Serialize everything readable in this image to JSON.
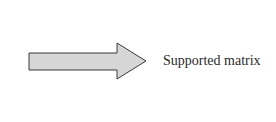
{
  "diagram": {
    "arrow": {
      "direction": "right",
      "fill": "#d6d6d6",
      "stroke": "#3a3a3a"
    },
    "label": "Supported matrix"
  }
}
